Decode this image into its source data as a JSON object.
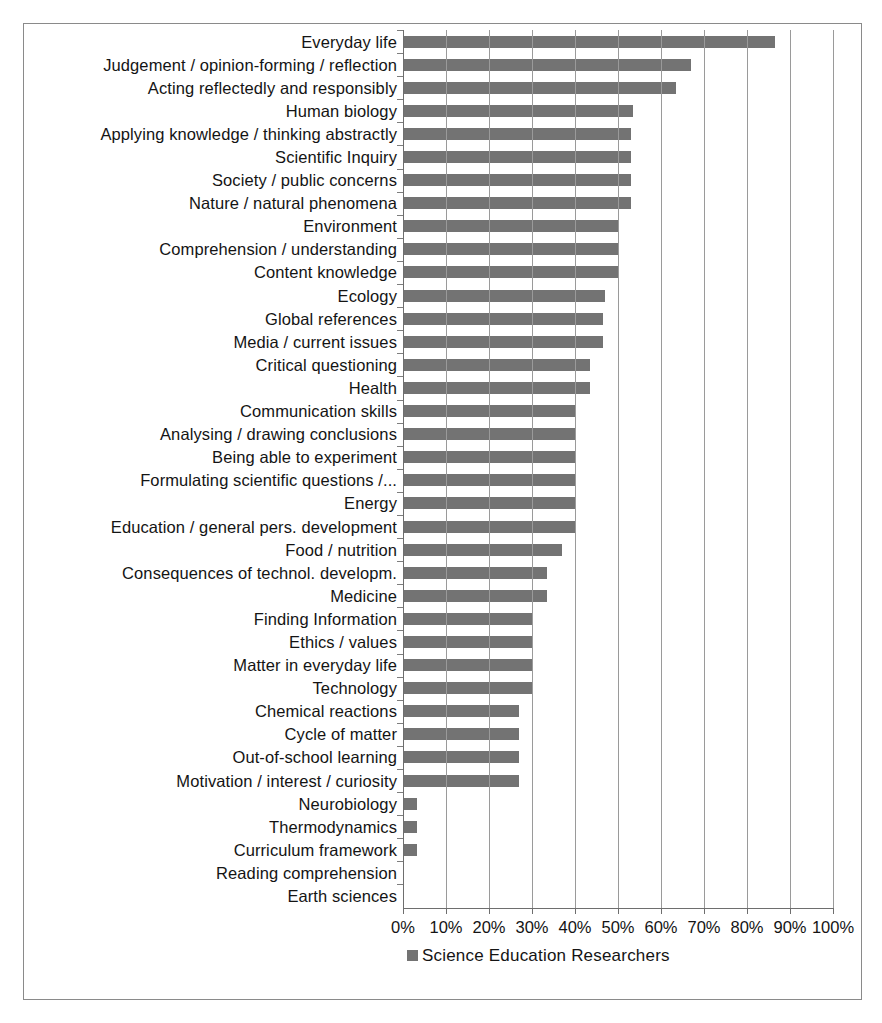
{
  "chart_data": {
    "type": "bar",
    "orientation": "horizontal",
    "title": "",
    "xlabel": "",
    "ylabel": "",
    "xlim": [
      0,
      100
    ],
    "xunit": "%",
    "grid": true,
    "legend_position": "bottom",
    "bar_color": "#737373",
    "xticks": [
      "0%",
      "10%",
      "20%",
      "30%",
      "40%",
      "50%",
      "60%",
      "70%",
      "80%",
      "90%",
      "100%"
    ],
    "xtick_values": [
      0,
      10,
      20,
      30,
      40,
      50,
      60,
      70,
      80,
      90,
      100
    ],
    "series": [
      {
        "name": "Science Education Researchers",
        "values": [
          86.5,
          67,
          63.5,
          53.5,
          53,
          53,
          53,
          53,
          50,
          50,
          50,
          47,
          46.5,
          46.5,
          43.5,
          43.5,
          40,
          40,
          40,
          40,
          40,
          40,
          37,
          33.5,
          33.5,
          30,
          30,
          30,
          30,
          27,
          27,
          27,
          27,
          3.3,
          3.3,
          3.3,
          0,
          0
        ]
      }
    ],
    "categories": [
      "Everyday life",
      "Judgement / opinion-forming / reflection",
      "Acting reflectedly and responsibly",
      "Human biology",
      "Applying knowledge / thinking abstractly",
      "Scientific Inquiry",
      "Society / public concerns",
      "Nature / natural phenomena",
      "Environment",
      "Comprehension / understanding",
      "Content knowledge",
      "Ecology",
      "Global references",
      "Media / current issues",
      "Critical questioning",
      "Health",
      "Communication skills",
      "Analysing / drawing conclusions",
      "Being able to experiment",
      "Formulating scientific questions /...",
      "Energy",
      "Education / general pers. development",
      "Food / nutrition",
      "Consequences of technol. developm.",
      "Medicine",
      "Finding Information",
      "Ethics / values",
      "Matter in everyday life",
      "Technology",
      "Chemical reactions",
      "Cycle of matter",
      "Out-of-school learning",
      "Motivation / interest / curiosity",
      "Neurobiology",
      "Thermodynamics",
      "Curriculum framework",
      "Reading comprehension",
      "Earth sciences"
    ]
  },
  "legend": {
    "marker": "square-marker-icon",
    "label": "Science Education Researchers"
  }
}
